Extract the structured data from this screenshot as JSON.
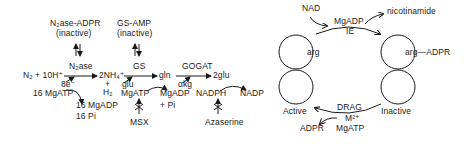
{
  "left_diagram": {
    "n2ase_adpr": "N₂ase-ADPR",
    "n2ase_adpr_state": "(inactive)",
    "gs_amp": "GS-AMP",
    "gs_amp_state": "(inactive)",
    "n2ase": "N₂ase",
    "gs": "GS",
    "gogat": "GOGAT",
    "substrate": "N₂ + 10H⁺",
    "nh4": "2NH₄⁺",
    "h2_plus": "+",
    "h2": "H₂",
    "gln": "gln",
    "two_glu": "2glu",
    "electrons": "8e⁻",
    "glu": "glu",
    "akg": "αkg",
    "mgatp_16": "16 MgATP",
    "mgadp_16": "16 MgADP",
    "pi_16": "16 Pi",
    "mgatp": "MgATP",
    "mgadp": "MgADP",
    "pi": "+ Pi",
    "nadph": "NADPH",
    "nadp": "NADP",
    "msx": "MSX",
    "azaserine": "Azaserine"
  },
  "right_diagram": {
    "nad": "NAD",
    "nicotinamide": "nicotinamide",
    "mgadp": "MgADP",
    "ie": "IE",
    "arg": "arg",
    "arg_adpr": "arg—ADPR",
    "active": "Active",
    "inactive": "Inactive",
    "drag": "DRAG",
    "metal": "M²⁺",
    "mgatp": "MgATP",
    "adpr": "ADPR"
  }
}
